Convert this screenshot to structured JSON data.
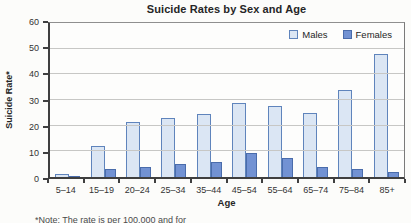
{
  "chart": {
    "title": "Suicide Rates by Sex and Age",
    "ylabel": "Suicide Rate*",
    "xlabel": "Age",
    "note_fragment": "*Note: The rate is per 100,000 and for",
    "legend": {
      "males_label": "Males",
      "females_label": "Females"
    }
  },
  "chart_data": {
    "type": "bar",
    "title": "Suicide Rates by Sex and Age",
    "xlabel": "Age",
    "ylabel": "Suicide Rate*",
    "categories": [
      "5–14",
      "15–19",
      "20–24",
      "25–34",
      "35–44",
      "45–54",
      "55–64",
      "65–74",
      "75–84",
      "85+"
    ],
    "series": [
      {
        "name": "Males",
        "fill": "#dbe6f4",
        "border": "#5f84bc",
        "values": [
          1,
          12,
          21.5,
          23,
          24.5,
          29,
          27.5,
          25,
          34,
          48
        ]
      },
      {
        "name": "Females",
        "fill": "#7292d3",
        "border": "#4a6cab",
        "values": [
          0.5,
          3,
          4,
          5,
          6,
          9.5,
          7.5,
          4,
          3,
          2
        ]
      }
    ],
    "ylim": [
      0,
      60
    ],
    "yticks": [
      0,
      10,
      20,
      30,
      40,
      50,
      60
    ],
    "grid": true,
    "legend_position": "top-right-inside"
  }
}
